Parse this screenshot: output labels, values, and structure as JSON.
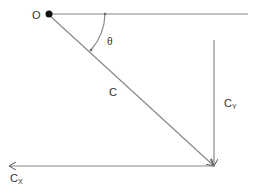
{
  "diagram": {
    "type": "vector-decomposition",
    "colors": {
      "line": "#888888",
      "dot": "#111111",
      "text": "#333333"
    },
    "labels": {
      "origin": "O",
      "angle": "θ",
      "vector": "C",
      "y_component_main": "C",
      "y_component_sub": "Y",
      "x_component_main": "C",
      "x_component_sub": "X"
    }
  }
}
